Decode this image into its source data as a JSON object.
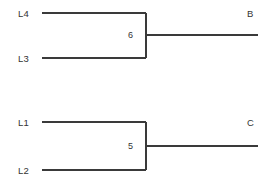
{
  "figure": {
    "type": "dendrogram",
    "background_color": "#ffffff",
    "line_color": "#3a3a3a",
    "text_color": "#333333",
    "line_width": 1.4,
    "width": 271,
    "height": 184
  },
  "clusters": [
    {
      "id": "cluster-b",
      "merge_label": "6",
      "root_label": "B",
      "leaves": [
        {
          "label": "L4",
          "label_x": 18,
          "label_y": 9,
          "line_x1": 42,
          "line_x2": 146,
          "line_y": 13
        },
        {
          "label": "L3",
          "label_x": 18,
          "label_y": 54,
          "line_x1": 42,
          "line_x2": 146,
          "line_y": 58
        }
      ],
      "connector": {
        "x": 146,
        "y1": 13,
        "y2": 58
      },
      "stem": {
        "x1": 146,
        "x2": 258,
        "y": 35
      },
      "merge_label_pos": {
        "x": 128,
        "y": 31
      },
      "root_label_pos": {
        "x": 247,
        "y": 9
      }
    },
    {
      "id": "cluster-c",
      "merge_label": "5",
      "root_label": "C",
      "leaves": [
        {
          "label": "L1",
          "label_x": 18,
          "label_y": 118,
          "line_x1": 42,
          "line_x2": 146,
          "line_y": 122
        },
        {
          "label": "L2",
          "label_x": 18,
          "label_y": 166,
          "line_x1": 42,
          "line_x2": 146,
          "line_y": 170
        }
      ],
      "connector": {
        "x": 146,
        "y1": 122,
        "y2": 170
      },
      "stem": {
        "x1": 146,
        "x2": 258,
        "y": 146
      },
      "merge_label_pos": {
        "x": 128,
        "y": 142
      },
      "root_label_pos": {
        "x": 247,
        "y": 118
      }
    }
  ]
}
